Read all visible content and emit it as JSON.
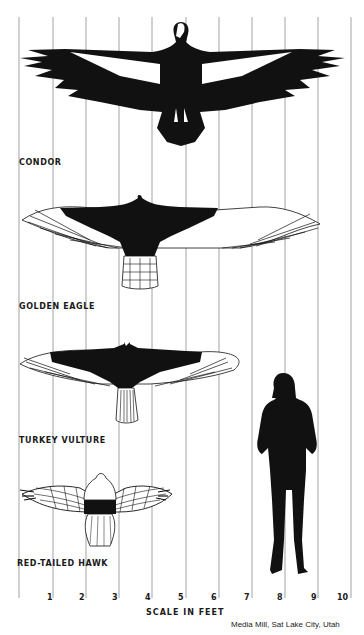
{
  "diagram": {
    "scale": {
      "title": "SCALE IN FEET",
      "ticks": [
        "1",
        "2",
        "3",
        "4",
        "5",
        "6",
        "7",
        "8",
        "9",
        "10"
      ]
    },
    "birds": [
      {
        "name": "CONDOR",
        "wingspan_ft": 9.7
      },
      {
        "name": "GOLDEN EAGLE",
        "wingspan_ft": 7.3
      },
      {
        "name": "TURKEY VULTURE",
        "wingspan_ft": 6.4
      },
      {
        "name": "RED-TAILED HAWK",
        "wingspan_ft": 4.5
      }
    ],
    "human": {
      "name": "woman silhouette",
      "height_ft": 5.6
    },
    "credit": "Media Mill, Sat Lake City, Utah"
  }
}
